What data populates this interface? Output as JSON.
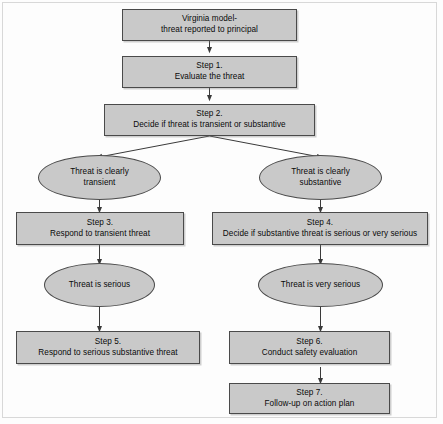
{
  "diagram": {
    "fill_color": "#c9c9c9",
    "stroke_color": "#4a4a4a",
    "background_color": "#fdfdfd",
    "nodes": [
      {
        "id": "start",
        "shape": "box",
        "label": "Virginia model-\nthreat reported to principal"
      },
      {
        "id": "step1",
        "shape": "box",
        "label": "Step 1.\nEvaluate the threat"
      },
      {
        "id": "step2",
        "shape": "box",
        "label": "Step 2.\nDecide if threat is transient or substantive"
      },
      {
        "id": "transient",
        "shape": "ellipse",
        "label": "Threat is clearly\ntransient"
      },
      {
        "id": "substantive",
        "shape": "ellipse",
        "label": "Threat is clearly\nsubstantive"
      },
      {
        "id": "step3",
        "shape": "box",
        "label": "Step 3.\nRespond to transient threat"
      },
      {
        "id": "step4",
        "shape": "box",
        "label": "Step 4.\nDecide if substantive threat is serious or very serious"
      },
      {
        "id": "serious",
        "shape": "ellipse",
        "label": "Threat is serious"
      },
      {
        "id": "very_serious",
        "shape": "ellipse",
        "label": "Threat is very serious"
      },
      {
        "id": "step5",
        "shape": "box",
        "label": "Step 5.\nRespond to serious substantive threat"
      },
      {
        "id": "step6",
        "shape": "box",
        "label": "Step 6.\nConduct safety evaluation"
      },
      {
        "id": "step7",
        "shape": "box",
        "label": "Step 7.\nFollow-up on action plan"
      }
    ],
    "edges": [
      {
        "from": "start",
        "to": "step1"
      },
      {
        "from": "step1",
        "to": "step2"
      },
      {
        "from": "step2",
        "to": "transient"
      },
      {
        "from": "step2",
        "to": "substantive"
      },
      {
        "from": "transient",
        "to": "step3"
      },
      {
        "from": "substantive",
        "to": "step4"
      },
      {
        "from": "step3",
        "to": "serious"
      },
      {
        "from": "step4",
        "to": "very_serious"
      },
      {
        "from": "serious",
        "to": "step5"
      },
      {
        "from": "very_serious",
        "to": "step6"
      },
      {
        "from": "step6",
        "to": "step7"
      }
    ]
  }
}
